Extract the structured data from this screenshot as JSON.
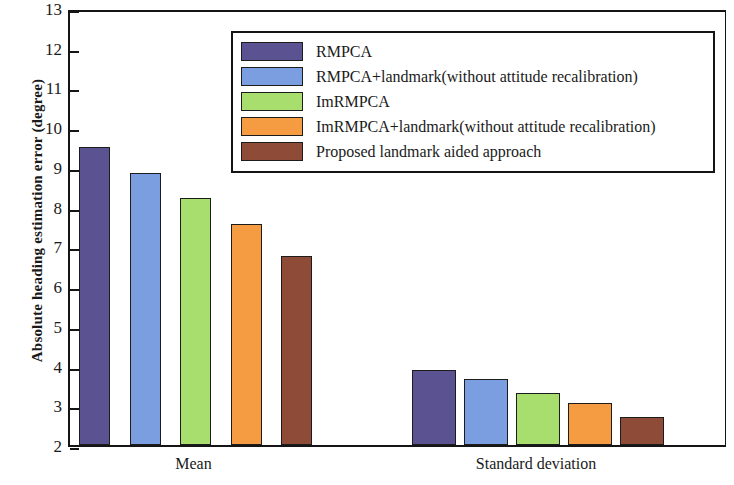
{
  "chart_data": {
    "type": "bar",
    "title": "",
    "subtitle": "",
    "xlabel": "",
    "ylabel": "Absolute heading estimation error (degree)",
    "categories": [
      "Mean",
      "Standard deviation"
    ],
    "ylim": [
      2,
      13
    ],
    "ytick_labels": [
      "2",
      "3",
      "4",
      "5",
      "6",
      "7",
      "8",
      "9",
      "10",
      "11",
      "12",
      "13"
    ],
    "yticks": [
      2,
      3,
      4,
      5,
      6,
      7,
      8,
      9,
      10,
      11,
      12,
      13
    ],
    "grid": false,
    "legend_position": "upper-right-inside",
    "series": [
      {
        "name": "RMPCA",
        "color": "#5b5391",
        "values": [
          9.55,
          3.95
        ]
      },
      {
        "name": "RMPCA+landmark(without attitude recalibration)",
        "color": "#7b9ee0",
        "values": [
          8.9,
          3.7
        ]
      },
      {
        "name": "ImRMPCA",
        "color": "#a8de6e",
        "values": [
          8.27,
          3.37
        ]
      },
      {
        "name": "ImRMPCA+landmark(without attitude recalibration)",
        "color": "#f59b42",
        "values": [
          7.62,
          3.12
        ]
      },
      {
        "name": "Proposed landmark aided approach",
        "color": "#8e4b38",
        "values": [
          6.82,
          2.75
        ]
      }
    ]
  },
  "legend": {
    "items": [
      {
        "label": "RMPCA",
        "color": "#5b5391"
      },
      {
        "label": "RMPCA+landmark(without attitude recalibration)",
        "color": "#7b9ee0"
      },
      {
        "label": "ImRMPCA",
        "color": "#a8de6e"
      },
      {
        "label": "ImRMPCA+landmark(without attitude recalibration)",
        "color": "#f59b42"
      },
      {
        "label": "Proposed landmark aided approach",
        "color": "#8e4b38"
      }
    ]
  },
  "axes": {
    "y_title": "Absolute heading estimation error (degree)",
    "x_tick_labels": [
      "Mean",
      "Standard deviation"
    ]
  }
}
